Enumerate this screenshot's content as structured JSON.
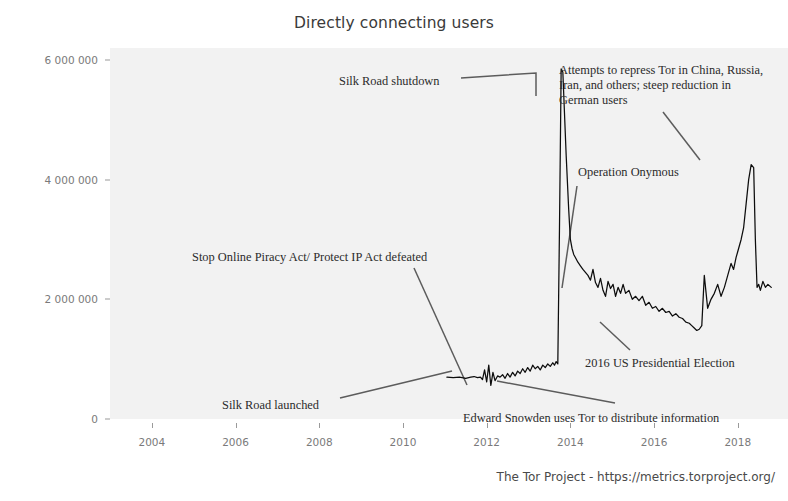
{
  "chart_data": {
    "type": "line",
    "title": "Directly connecting users",
    "xlabel": "",
    "ylabel": "",
    "xlim": [
      2003.0,
      2019.2
    ],
    "ylim": [
      0,
      6200000
    ],
    "grid": false,
    "legend": null,
    "xticks": [
      "2004",
      "2006",
      "2008",
      "2010",
      "2012",
      "2014",
      "2016",
      "2018"
    ],
    "xtick_values": [
      2004,
      2006,
      2008,
      2010,
      2012,
      2014,
      2016,
      2018
    ],
    "yticks": [
      "0",
      "2 000 000",
      "4 000 000",
      "6 000 000"
    ],
    "ytick_values": [
      0,
      2000000,
      4000000,
      6000000
    ],
    "series": [
      {
        "name": "Directly connecting users",
        "color": "#0d0d0d",
        "x": [
          2011.05,
          2011.2,
          2011.35,
          2011.5,
          2011.62,
          2011.7,
          2011.78,
          2011.85,
          2011.9,
          2011.95,
          2012.0,
          2012.05,
          2012.1,
          2012.15,
          2012.2,
          2012.26,
          2012.32,
          2012.38,
          2012.44,
          2012.5,
          2012.56,
          2012.62,
          2012.68,
          2012.74,
          2012.8,
          2012.86,
          2012.92,
          2012.98,
          2013.04,
          2013.1,
          2013.16,
          2013.22,
          2013.28,
          2013.34,
          2013.4,
          2013.46,
          2013.52,
          2013.58,
          2013.62,
          2013.66,
          2013.7,
          2013.74,
          2013.78,
          2013.82,
          2013.9,
          2013.96,
          2014.0,
          2014.04,
          2014.08,
          2014.12,
          2014.18,
          2014.24,
          2014.3,
          2014.36,
          2014.42,
          2014.48,
          2014.54,
          2014.6,
          2014.66,
          2014.72,
          2014.78,
          2014.84,
          2014.9,
          2014.96,
          2015.02,
          2015.08,
          2015.14,
          2015.2,
          2015.26,
          2015.32,
          2015.4,
          2015.48,
          2015.56,
          2015.64,
          2015.72,
          2015.8,
          2015.88,
          2015.96,
          2016.04,
          2016.12,
          2016.2,
          2016.28,
          2016.36,
          2016.44,
          2016.52,
          2016.6,
          2016.68,
          2016.76,
          2016.84,
          2016.9,
          2016.96,
          2017.02,
          2017.08,
          2017.14,
          2017.2,
          2017.28,
          2017.36,
          2017.44,
          2017.52,
          2017.6,
          2017.68,
          2017.76,
          2017.84,
          2017.9,
          2017.96,
          2018.02,
          2018.08,
          2018.14,
          2018.2,
          2018.26,
          2018.32,
          2018.38,
          2018.42,
          2018.46,
          2018.5,
          2018.54,
          2018.6,
          2018.66,
          2018.72,
          2018.8
        ],
        "y": [
          700000,
          690000,
          700000,
          680000,
          700000,
          710000,
          690000,
          700000,
          660000,
          820000,
          620000,
          900000,
          560000,
          780000,
          640000,
          720000,
          700000,
          740000,
          680000,
          760000,
          700000,
          780000,
          720000,
          800000,
          760000,
          840000,
          780000,
          860000,
          800000,
          900000,
          840000,
          880000,
          820000,
          900000,
          860000,
          920000,
          880000,
          940000,
          900000,
          960000,
          920000,
          3200000,
          5850000,
          5800000,
          4400000,
          3500000,
          3000000,
          2850000,
          2750000,
          2700000,
          2620000,
          2560000,
          2500000,
          2450000,
          2400000,
          2320000,
          2500000,
          2280000,
          2200000,
          2350000,
          2150000,
          2050000,
          2300000,
          2180000,
          2250000,
          2050000,
          2200000,
          2100000,
          2250000,
          2100000,
          2150000,
          2000000,
          2050000,
          1980000,
          2050000,
          1900000,
          1950000,
          1850000,
          1880000,
          1800000,
          1850000,
          1780000,
          1800000,
          1720000,
          1760000,
          1700000,
          1680000,
          1620000,
          1600000,
          1560000,
          1520000,
          1480000,
          1500000,
          1560000,
          2400000,
          1850000,
          2000000,
          2100000,
          2250000,
          2050000,
          2200000,
          2400000,
          2600000,
          2500000,
          2700000,
          2850000,
          3000000,
          3200000,
          3600000,
          4000000,
          4250000,
          4200000,
          3000000,
          2200000,
          2250000,
          2150000,
          2300000,
          2200000,
          2250000,
          2200000
        ]
      }
    ],
    "annotations": [
      {
        "id": "silk-road-shutdown",
        "text": "Silk Road shutdown",
        "x_px": 339,
        "y_px": 74,
        "leader": [
          [
            461,
            78
          ],
          [
            536,
            73
          ],
          [
            536,
            96
          ]
        ]
      },
      {
        "id": "repression-attempts",
        "text": "Attempts to repress Tor in China, Russia,\nIran, and others; steep reduction in\nGerman users",
        "x_px": 559,
        "y_px": 63,
        "leader": [
          [
            663,
            112
          ],
          [
            700,
            160
          ]
        ]
      },
      {
        "id": "operation-onymous",
        "text": "Operation Onymous",
        "x_px": 578,
        "y_px": 165,
        "leader": [
          [
            577,
            186
          ],
          [
            562,
            288
          ]
        ]
      },
      {
        "id": "sopa-pipa-defeated",
        "text": "Stop Online Piracy Act/ Protect IP Act defeated",
        "x_px": 192,
        "y_px": 250,
        "leader": [
          [
            414,
            268
          ],
          [
            467,
            385
          ]
        ]
      },
      {
        "id": "2016-us-presidential-election",
        "text": "2016 US Presidential Election",
        "x_px": 585,
        "y_px": 356,
        "leader": [
          [
            630,
            350
          ],
          [
            600,
            322
          ]
        ]
      },
      {
        "id": "silk-road-launched",
        "text": "Silk Road launched",
        "x_px": 222,
        "y_px": 398,
        "leader": [
          [
            340,
            398
          ],
          [
            452,
            371
          ]
        ]
      },
      {
        "id": "edward-snowden",
        "text": "Edward Snowden uses Tor to distribute information",
        "x_px": 463,
        "y_px": 411,
        "leader": [
          [
            615,
            403
          ],
          [
            497,
            381
          ]
        ]
      }
    ]
  },
  "caption": {
    "text": "The Tor Project - https://metrics.torproject.org/"
  },
  "colors": {
    "plot_background": "#f2f2f2",
    "page_background": "#ffffff",
    "series_line": "#0d0d0d",
    "leader_line": "#5c5c5c",
    "tick_text": "#7a7a7a",
    "title_text": "#3a3a3a",
    "annotation_text": "#2b2b2b"
  }
}
